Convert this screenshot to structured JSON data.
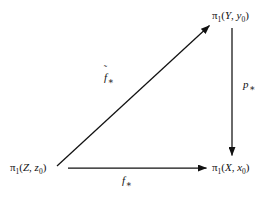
{
  "diagram": {
    "background_color": "#ffffff",
    "stroke_color": "#111111",
    "nodes": [
      {
        "id": "pi1-Z",
        "role": "bottom-left",
        "pi": "π",
        "pi_sub": "1",
        "open": "(",
        "space": "Z",
        "comma": ",",
        "basepoint": "z",
        "basepoint_sub": "0",
        "close": ")",
        "full_text": "π1(Z, z0)"
      },
      {
        "id": "pi1-Y",
        "role": "top-right",
        "pi": "π",
        "pi_sub": "1",
        "open": "(",
        "space": "Y",
        "comma": ",",
        "basepoint": "y",
        "basepoint_sub": "0",
        "close": ")",
        "full_text": "π1(Y, y0)"
      },
      {
        "id": "pi1-X",
        "role": "bottom-right",
        "pi": "π",
        "pi_sub": "1",
        "open": "(",
        "space": "X",
        "comma": ",",
        "basepoint": "x",
        "basepoint_sub": "0",
        "close": ")",
        "full_text": "π1(X, x0)"
      }
    ],
    "arrows": [
      {
        "id": "diagonal-arrow",
        "from": "pi1-Z",
        "to": "pi1-Y",
        "direction": "up-right",
        "label_base": "f",
        "label_accent": "˜",
        "label_star": "∗",
        "label_text": "f̃∗"
      },
      {
        "id": "vertical-arrow",
        "from": "pi1-Y",
        "to": "pi1-X",
        "direction": "down",
        "label_base": "p",
        "label_accent": "",
        "label_star": "∗",
        "label_text": "p∗"
      },
      {
        "id": "horizontal-arrow",
        "from": "pi1-Z",
        "to": "pi1-X",
        "direction": "right",
        "label_base": "f",
        "label_accent": "",
        "label_star": "∗",
        "label_text": "f∗"
      }
    ]
  }
}
